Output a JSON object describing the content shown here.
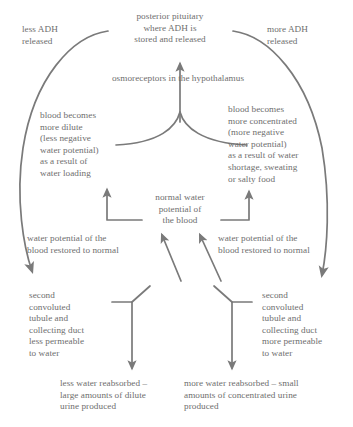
{
  "diagram": {
    "stroke_color": "#7a7a7a",
    "text_color": "#6e6e6e",
    "background_color": "#ffffff",
    "nodes": {
      "posterior_pituitary": "posterior pituitary\nwhere ADH is\nstored and released",
      "less_adh": "less ADH\nreleased",
      "more_adh": "more ADH\nreleased",
      "osmoreceptors": "osmoreceptors in the hypothalamus",
      "blood_dilute": "blood becomes\nmore dilute\n(less negative\nwater potential)\nas a result of\nwater loading",
      "blood_concentrated": "blood becomes\nmore concentrated\n(more negative\nwater potential)\nas a result of water\nshortage, sweating\nor salty food",
      "normal_water_potential": "normal water\npotential of\nthe blood",
      "restored_left": "water potential of the\nblood restored to normal",
      "restored_right": "water potential of the\nblood restored to normal",
      "sct_less_permeable": "second\nconvoluted\ntubule and\ncollecting duct\nless permeable\nto water",
      "sct_more_permeable": "second\nconvoluted\ntubule and\ncollecting duct\nmore permeable\nto water",
      "less_water_reabsorbed": "less water reabsorbed –\nlarge amounts of dilute\nurine produced",
      "more_water_reabsorbed": "more water reabsorbed – small\namounts of concentrated urine\nproduced"
    }
  }
}
